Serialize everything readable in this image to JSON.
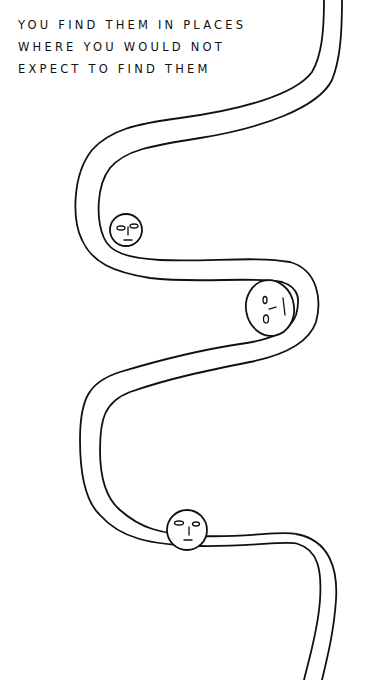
{
  "caption": {
    "lines": [
      "You find them in places",
      "where you would not",
      "expect to find them"
    ]
  },
  "illustration": {
    "subject": "winding path",
    "faces": [
      {
        "name": "top-face",
        "position": "inner curve left",
        "expression": "neutral"
      },
      {
        "name": "middle-face",
        "position": "inner curve right",
        "expression": "sideways"
      },
      {
        "name": "bottom-face",
        "position": "on bottom straight",
        "expression": "neutral"
      }
    ],
    "ink_color": "#111111",
    "background_color": "#ffffff"
  }
}
